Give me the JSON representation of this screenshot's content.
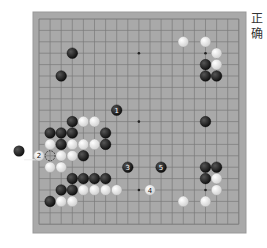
{
  "title_vertical": "正确",
  "caption_bottom": "",
  "board": {
    "size": 19,
    "colors": {
      "board": "#a9a9a9",
      "line": "#7a7a7a",
      "black": "#1a1a1a",
      "white": "#f2f2f2"
    },
    "star_points": [
      [
        3,
        3
      ],
      [
        9,
        3
      ],
      [
        15,
        3
      ],
      [
        3,
        9
      ],
      [
        9,
        9
      ],
      [
        15,
        9
      ],
      [
        3,
        15
      ],
      [
        9,
        15
      ],
      [
        15,
        15
      ]
    ],
    "stones": [
      {
        "c": 13,
        "r": 2,
        "color": "white"
      },
      {
        "c": 15,
        "r": 2,
        "color": "white"
      },
      {
        "c": 16,
        "r": 3,
        "color": "white"
      },
      {
        "c": 15,
        "r": 4,
        "color": "black"
      },
      {
        "c": 16,
        "r": 4,
        "color": "white"
      },
      {
        "c": 15,
        "r": 5,
        "color": "black"
      },
      {
        "c": 16,
        "r": 5,
        "color": "black"
      },
      {
        "c": 3,
        "r": 3,
        "color": "black"
      },
      {
        "c": 2,
        "r": 5,
        "color": "black"
      },
      {
        "c": 7,
        "r": 8,
        "color": "black",
        "label": "1"
      },
      {
        "c": 15,
        "r": 9,
        "color": "black"
      },
      {
        "c": 3,
        "r": 9,
        "color": "black"
      },
      {
        "c": 4,
        "r": 9,
        "color": "white"
      },
      {
        "c": 5,
        "r": 9,
        "color": "white"
      },
      {
        "c": 1,
        "r": 10,
        "color": "black"
      },
      {
        "c": 2,
        "r": 10,
        "color": "black"
      },
      {
        "c": 3,
        "r": 10,
        "color": "black"
      },
      {
        "c": 6,
        "r": 10,
        "color": "black"
      },
      {
        "c": 1,
        "r": 11,
        "color": "white"
      },
      {
        "c": 2,
        "r": 11,
        "color": "black"
      },
      {
        "c": 3,
        "r": 11,
        "color": "white"
      },
      {
        "c": 4,
        "r": 11,
        "color": "white"
      },
      {
        "c": 5,
        "r": 11,
        "color": "white"
      },
      {
        "c": 6,
        "r": 11,
        "color": "black"
      },
      {
        "c": 0,
        "r": 12,
        "color": "white",
        "label": "2"
      },
      {
        "c": 2,
        "r": 12,
        "color": "white"
      },
      {
        "c": 3,
        "r": 12,
        "color": "white"
      },
      {
        "c": 4,
        "r": 12,
        "color": "black"
      },
      {
        "c": 1,
        "r": 13,
        "color": "white"
      },
      {
        "c": 2,
        "r": 13,
        "color": "white"
      },
      {
        "c": 8,
        "r": 13,
        "color": "black",
        "label": "3"
      },
      {
        "c": 11,
        "r": 13,
        "color": "black",
        "label": "5"
      },
      {
        "c": 15,
        "r": 13,
        "color": "black"
      },
      {
        "c": 16,
        "r": 13,
        "color": "black"
      },
      {
        "c": 3,
        "r": 14,
        "color": "black"
      },
      {
        "c": 4,
        "r": 14,
        "color": "black"
      },
      {
        "c": 5,
        "r": 14,
        "color": "black"
      },
      {
        "c": 6,
        "r": 14,
        "color": "black"
      },
      {
        "c": 15,
        "r": 14,
        "color": "black"
      },
      {
        "c": 16,
        "r": 14,
        "color": "white"
      },
      {
        "c": 2,
        "r": 15,
        "color": "black"
      },
      {
        "c": 3,
        "r": 15,
        "color": "black"
      },
      {
        "c": 4,
        "r": 15,
        "color": "white"
      },
      {
        "c": 5,
        "r": 15,
        "color": "white"
      },
      {
        "c": 6,
        "r": 15,
        "color": "white"
      },
      {
        "c": 7,
        "r": 15,
        "color": "white"
      },
      {
        "c": 10,
        "r": 15,
        "color": "white",
        "label": "4"
      },
      {
        "c": 16,
        "r": 15,
        "color": "white"
      },
      {
        "c": 1,
        "r": 16,
        "color": "black"
      },
      {
        "c": 2,
        "r": 16,
        "color": "white"
      },
      {
        "c": 3,
        "r": 16,
        "color": "white"
      },
      {
        "c": 13,
        "r": 16,
        "color": "white"
      },
      {
        "c": 15,
        "r": 16,
        "color": "white"
      }
    ],
    "marked_points": [
      {
        "c": 1,
        "r": 12,
        "marker": "dashed-circle"
      }
    ],
    "offboard_stones": [
      {
        "x": 19,
        "y": 151,
        "color": "black"
      }
    ]
  }
}
